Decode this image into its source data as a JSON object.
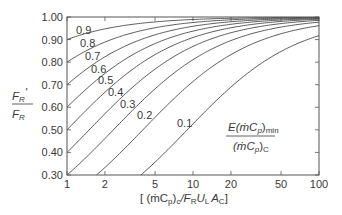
{
  "chart_data": {
    "type": "line",
    "title": "",
    "xlabel": "[ (ṁCp)c / FR UL Ac ]",
    "ylabel": "FR' / FR",
    "xscale": "log",
    "xlim": [
      1,
      100
    ],
    "ylim": [
      0.3,
      1.0
    ],
    "grid": false,
    "xticks": [
      1,
      2,
      5,
      10,
      20,
      50,
      100
    ],
    "xtick_labels": [
      "1",
      "2",
      "5",
      "10",
      "20",
      "50",
      "100"
    ],
    "yticks": [
      0.3,
      0.4,
      0.5,
      0.6,
      0.7,
      0.8,
      0.9,
      1.0
    ],
    "ytick_labels": [
      "0.30",
      "0.40",
      "0.50",
      "0.60",
      "0.70",
      "0.80",
      "0.90",
      "1.00"
    ],
    "parameter_label": "E(ṁCp)min / (ṁCp)C",
    "x": [
      1,
      1.5,
      2,
      3,
      5,
      7,
      10,
      15,
      20,
      30,
      50,
      70,
      100
    ],
    "series": [
      {
        "name": "0.9",
        "values": [
          0.9,
          0.931,
          0.947,
          0.964,
          0.978,
          0.984,
          0.989,
          0.993,
          0.994,
          0.996,
          0.998,
          0.998,
          0.999
        ]
      },
      {
        "name": "0.8",
        "values": [
          0.8,
          0.857,
          0.889,
          0.923,
          0.952,
          0.966,
          0.976,
          0.984,
          0.988,
          0.992,
          0.995,
          0.996,
          0.998
        ]
      },
      {
        "name": "0.7",
        "values": [
          0.7,
          0.778,
          0.824,
          0.875,
          0.921,
          0.942,
          0.959,
          0.972,
          0.979,
          0.986,
          0.992,
          0.994,
          0.996
        ]
      },
      {
        "name": "0.6",
        "values": [
          0.6,
          0.692,
          0.75,
          0.818,
          0.882,
          0.913,
          0.938,
          0.957,
          0.968,
          0.978,
          0.987,
          0.991,
          0.993
        ]
      },
      {
        "name": "0.5",
        "values": [
          0.5,
          0.6,
          0.667,
          0.75,
          0.833,
          0.875,
          0.909,
          0.938,
          0.952,
          0.968,
          0.98,
          0.986,
          0.99
        ]
      },
      {
        "name": "0.4",
        "values": [
          0.4,
          0.5,
          0.571,
          0.667,
          0.769,
          0.824,
          0.87,
          0.909,
          0.93,
          0.952,
          0.971,
          0.979,
          0.985
        ]
      },
      {
        "name": "0.3",
        "values": [
          0.3,
          0.391,
          0.462,
          0.563,
          0.682,
          0.75,
          0.811,
          0.865,
          0.896,
          0.928,
          0.955,
          0.968,
          0.977
        ]
      },
      {
        "name": "0.2",
        "values": [
          0.2,
          0.273,
          0.333,
          0.429,
          0.556,
          0.636,
          0.714,
          0.789,
          0.833,
          0.882,
          0.926,
          0.946,
          0.962
        ]
      },
      {
        "name": "0.1",
        "values": [
          0.1,
          0.143,
          0.182,
          0.25,
          0.357,
          0.438,
          0.526,
          0.625,
          0.69,
          0.769,
          0.847,
          0.886,
          0.917
        ]
      }
    ],
    "curve_labels": [
      {
        "text": "0.9",
        "x": 76,
        "y": 34
      },
      {
        "text": "0.8",
        "x": 80,
        "y": 47
      },
      {
        "text": "0.7",
        "x": 85,
        "y": 60
      },
      {
        "text": "0.6",
        "x": 91,
        "y": 73
      },
      {
        "text": "0.5",
        "x": 98,
        "y": 84
      },
      {
        "text": "0.4",
        "x": 108,
        "y": 96
      },
      {
        "text": "0.3",
        "x": 120,
        "y": 108
      },
      {
        "text": "0.2",
        "x": 137,
        "y": 119
      },
      {
        "text": "0.1",
        "x": 177,
        "y": 127
      }
    ]
  },
  "labels": {
    "y_num": "F",
    "y_num_sub": "R",
    "y_prime": "'",
    "y_den": "F",
    "y_den_sub": "R",
    "param_num": "E(ṁC",
    "param_num_sub1": "p",
    "param_num_close": ")",
    "param_num_sub2": "min",
    "param_den": "(ṁC",
    "param_den_sub1": "p",
    "param_den_close": ")",
    "param_den_sub2": "C",
    "x_open": "[ (ṁC",
    "x_sub_p": "p",
    "x_close_c": ")",
    "x_sub_c": "c",
    "x_slash": "/F",
    "x_sub_R": "R",
    "x_U": "U",
    "x_sub_L": "L",
    "x_A": "A",
    "x_sub_C": "C",
    "x_end": "]"
  }
}
